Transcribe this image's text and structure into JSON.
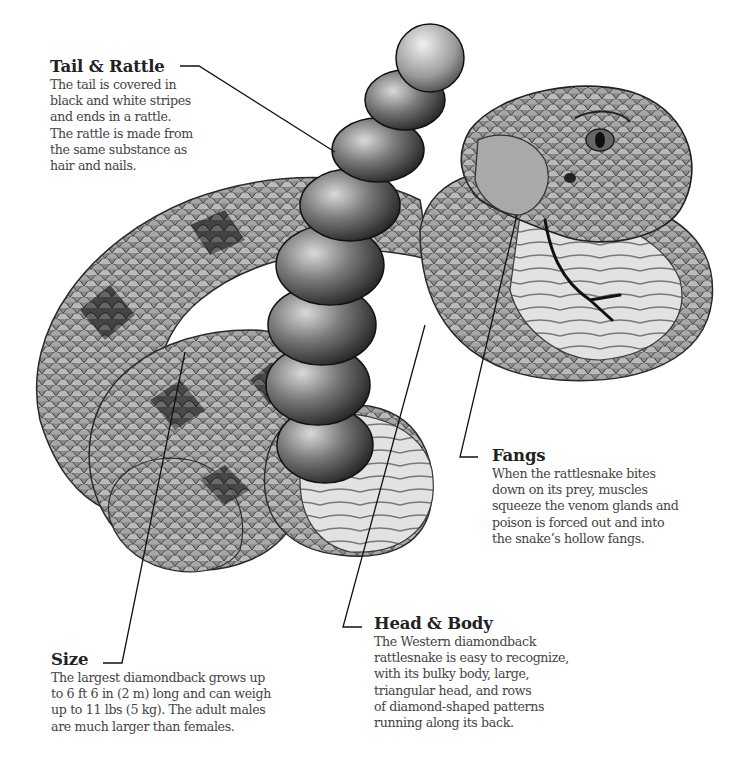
{
  "figure": {
    "subject": "Western diamondback rattlesnake",
    "style": "grayscale illustration with labeled callouts",
    "colors": {
      "background": "#ffffff",
      "heading_text": "#222222",
      "body_text": "#444444",
      "leader_line": "#111111"
    }
  },
  "callouts": [
    {
      "id": "tail",
      "title": "Tail & Rattle",
      "lines": [
        "The tail is covered in",
        "black and white stripes",
        "and ends in a rattle.",
        "The rattle is made from",
        "the same substance as",
        "hair and nails."
      ]
    },
    {
      "id": "fangs",
      "title": "Fangs",
      "lines": [
        "When the rattlesnake bites",
        "down on its prey, muscles",
        "squeeze the venom glands and",
        "poison is forced out and into",
        "the snake’s hollow fangs."
      ]
    },
    {
      "id": "head",
      "title": "Head & Body",
      "lines": [
        "The Western diamondback",
        "rattlesnake is easy to recognize,",
        "with its bulky body, large,",
        "triangular head, and rows",
        "of diamond-shaped patterns",
        "running along its back."
      ]
    },
    {
      "id": "size",
      "title": "Size",
      "lines": [
        "The largest diamondback grows up",
        "to 6 ft 6 in (2 m) long and can weigh",
        "up to 11 lbs (5 kg). The adult males",
        "are much larger than females."
      ]
    }
  ]
}
